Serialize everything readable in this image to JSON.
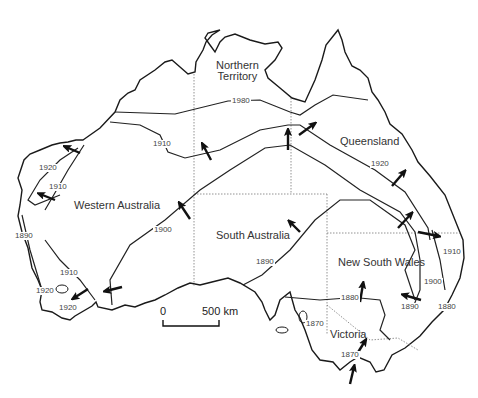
{
  "map": {
    "title": "",
    "states": {
      "northern_territory": "Northern\nTerritory",
      "nt_line1": "Northern",
      "nt_line2": "Territory",
      "queensland": "Queensland",
      "western_australia": "Western Australia",
      "south_australia": "South Australia",
      "new_south_wales": "New South Wales",
      "victoria": "Victoria"
    },
    "isoline_labels": {
      "nt_top": "1980",
      "wa_north_1910": "1910",
      "wa_west_1920": "1920",
      "wa_west_1910": "1910",
      "wa_coast_1890": "1890",
      "wa_south_1910": "1910",
      "wa_south_1920a": "1920",
      "wa_south_1920b": "1920",
      "wa_1900": "1900",
      "qld_1920": "1920",
      "sa_1890": "1890",
      "nsw_1910": "1910",
      "nsw_1900": "1900",
      "nsw_1890": "1890",
      "nsw_1880_coast": "1880",
      "nsw_1880_inland": "1880",
      "sa_1870": "1870",
      "vic_1870": "1870"
    },
    "scale_bar": {
      "start": "0",
      "end": "500 km"
    },
    "colors": {
      "coastline": "#1a1a1a",
      "isoline": "#222222",
      "border": "#777777",
      "arrow": "#111111"
    }
  }
}
